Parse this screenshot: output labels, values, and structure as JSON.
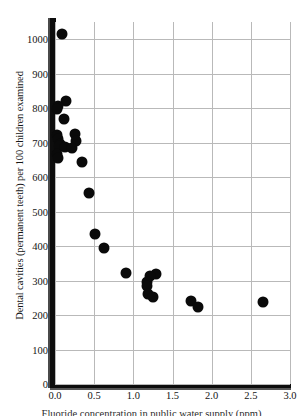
{
  "chart_data": {
    "type": "scatter",
    "title": "",
    "xlabel": "Fluoride concentration in public water supply (ppm)",
    "ylabel": "Dental cavities (permanent teeth) per 100 children examined",
    "xlim": [
      0.0,
      3.0
    ],
    "ylim": [
      0,
      1050
    ],
    "xticks": [
      "0.0",
      "0.5",
      "1.0",
      "1.5",
      "2.0",
      "2.5",
      "3.0"
    ],
    "xtick_values": [
      0.0,
      0.5,
      1.0,
      1.5,
      2.0,
      2.5,
      3.0
    ],
    "yticks": [
      "0",
      "100",
      "200",
      "300",
      "400",
      "500",
      "600",
      "700",
      "800",
      "900",
      "1000"
    ],
    "ytick_values": [
      0,
      100,
      200,
      300,
      400,
      500,
      600,
      700,
      800,
      900,
      1000
    ],
    "grid": true,
    "grid_color": "#b9b9b9",
    "marker_color": "#0a0a0a",
    "marker_shape": "circle",
    "marker_size_px": 11,
    "legend": null,
    "points": [
      {
        "x": 0.09,
        "y": 1015
      },
      {
        "x": 0.14,
        "y": 822
      },
      {
        "x": 0.04,
        "y": 805
      },
      {
        "x": 0.02,
        "y": 797
      },
      {
        "x": 0.12,
        "y": 768
      },
      {
        "x": 0.25,
        "y": 725
      },
      {
        "x": 0.02,
        "y": 722
      },
      {
        "x": 0.04,
        "y": 712
      },
      {
        "x": 0.27,
        "y": 705
      },
      {
        "x": 0.07,
        "y": 697
      },
      {
        "x": 0.05,
        "y": 690
      },
      {
        "x": 0.13,
        "y": 688
      },
      {
        "x": 0.22,
        "y": 685
      },
      {
        "x": 0.03,
        "y": 668
      },
      {
        "x": 0.04,
        "y": 655
      },
      {
        "x": 0.34,
        "y": 645
      },
      {
        "x": 0.44,
        "y": 555
      },
      {
        "x": 0.51,
        "y": 436
      },
      {
        "x": 0.63,
        "y": 394
      },
      {
        "x": 0.91,
        "y": 323
      },
      {
        "x": 1.29,
        "y": 318
      },
      {
        "x": 1.21,
        "y": 312
      },
      {
        "x": 1.17,
        "y": 297
      },
      {
        "x": 1.18,
        "y": 283
      },
      {
        "x": 1.19,
        "y": 262
      },
      {
        "x": 1.25,
        "y": 251
      },
      {
        "x": 1.74,
        "y": 241
      },
      {
        "x": 2.65,
        "y": 238
      },
      {
        "x": 1.83,
        "y": 224
      }
    ]
  }
}
